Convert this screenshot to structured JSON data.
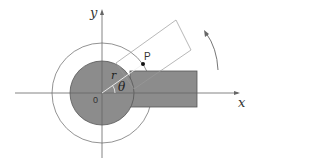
{
  "diagram": {
    "labels": {
      "x_axis": "x",
      "y_axis": "y",
      "origin": "0",
      "point": "P",
      "radius": "r",
      "angle": "θ"
    },
    "colors": {
      "fill": "#8c8c8c",
      "stroke": "#555555",
      "thin_line": "#888888",
      "background": "#ffffff"
    },
    "shapes": {
      "inner_disk": "filled circle centered at origin",
      "outer_circle": "thin circle centered at origin",
      "fixed_bar": "filled rectangle extending along +x axis",
      "rotated_frame": "outlined rectangle rotated by angle θ",
      "rotation_arrow": "curved arrow indicating counter-clockwise rotation"
    }
  }
}
